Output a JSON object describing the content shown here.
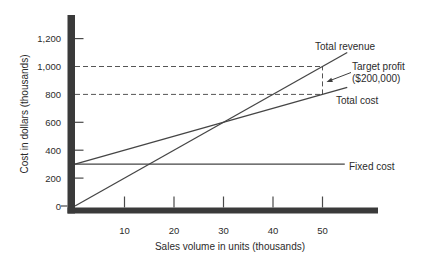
{
  "figure": {
    "background": "#ffffff",
    "ink_color": "#454545",
    "axis_bar_color": "#3a3a3a",
    "text_color": "#2b2b2b"
  },
  "labels": {
    "total_revenue": "Total revenue",
    "total_cost": "Total cost",
    "fixed_cost": "Fixed cost",
    "target_profit_line1": "Target profit",
    "target_profit_line2": "($200,000)"
  },
  "chart_data": {
    "type": "line",
    "title": "",
    "xlabel": "Sales volume in units (thousands)",
    "ylabel": "Cost in dollars (thousands)",
    "xlim": [
      0,
      55
    ],
    "ylim": [
      0,
      1300
    ],
    "grid": false,
    "x_ticks": [
      10,
      20,
      30,
      40,
      50
    ],
    "y_ticks": [
      0,
      200,
      400,
      600,
      800,
      1000,
      1200
    ],
    "y_tick_labels": [
      "0",
      "200",
      "400",
      "600",
      "800",
      "1,000",
      "1,200"
    ],
    "series": [
      {
        "name": "Total revenue",
        "points": [
          [
            0,
            0
          ],
          [
            55,
            1100
          ]
        ],
        "style": "solid"
      },
      {
        "name": "Total cost",
        "points": [
          [
            0,
            300
          ],
          [
            55,
            850
          ]
        ],
        "style": "solid"
      },
      {
        "name": "Fixed cost",
        "points": [
          [
            0,
            300
          ],
          [
            54.5,
            300
          ]
        ],
        "style": "solid"
      }
    ],
    "guides": [
      {
        "type": "h-dashed",
        "y": 1000,
        "x_from": 0,
        "x_to": 50
      },
      {
        "type": "h-dashed",
        "y": 800,
        "x_from": 0,
        "x_to": 50
      },
      {
        "type": "v-dashed",
        "x": 50,
        "y_from": 800,
        "y_to": 1000
      }
    ],
    "annotations": {
      "target_profit": {
        "text": [
          "Target profit",
          "($200,000)"
        ],
        "points_to_x": 50
      }
    },
    "legend_position": "inline-right"
  }
}
